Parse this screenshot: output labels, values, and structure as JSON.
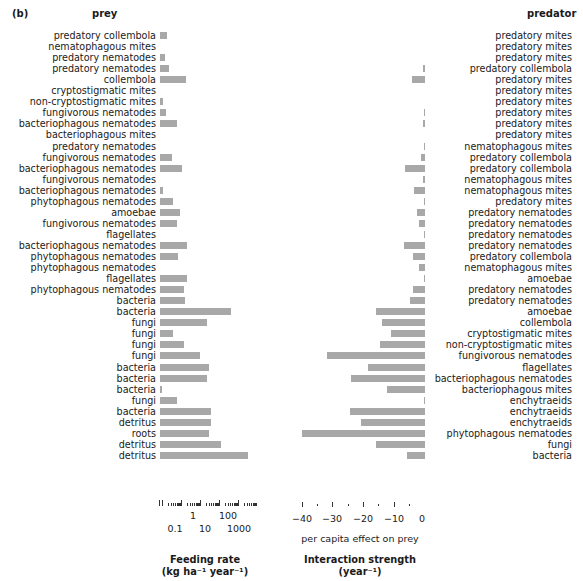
{
  "panel_label": "(b)",
  "headers": {
    "prey": "prey",
    "predator": "predator"
  },
  "axes": {
    "feeding_rate": {
      "tick_labels_top": [
        "1",
        "100"
      ],
      "tick_labels_bottom": [
        "0.1",
        "10",
        "1000"
      ],
      "title_line1": "Feeding rate",
      "title_line2": "(kg ha⁻¹ year⁻¹)"
    },
    "interaction_strength": {
      "tick_labels": [
        "−40",
        "−30",
        "−20",
        "−10",
        "0"
      ],
      "sublabel": "per capita effect on prey",
      "title_line1": "Interaction strength",
      "title_line2": "(year⁻¹)"
    }
  },
  "chart_data": [
    {
      "type": "bar",
      "orientation": "horizontal",
      "title": "Feeding rate (kg ha⁻¹ year⁻¹)",
      "xlabel": "Feeding rate (kg ha⁻¹ year⁻¹)",
      "xscale": "log",
      "xlim": [
        0.05,
        5000
      ],
      "xticks": [
        0.1,
        1,
        10,
        100,
        1000
      ],
      "categories": [
        "predatory collembola",
        "nematophagous mites",
        "predatory nematodes",
        "predatory nematodes",
        "collembola",
        "cryptostigmatic mites",
        "non-cryptostigmatic mites",
        "fungivorous nematodes",
        "bacteriophagous nematodes",
        "bacteriophagous mites",
        "predatory nematodes",
        "fungivorous nematodes",
        "bacteriophagous nematodes",
        "fungivorous nematodes",
        "bacteriophagous nematodes",
        "phytophagous nematodes",
        "amoebae",
        "fungivorous nematodes",
        "flagellates",
        "bacteriophagous nematodes",
        "phytophagous nematodes",
        "phytophagous nematodes",
        "flagellates",
        "phytophagous nematodes",
        "bacteria",
        "bacteria",
        "fungi",
        "fungi",
        "fungi",
        "fungi",
        "bacteria",
        "bacteria",
        "bacteria",
        "fungi",
        "bacteria",
        "detritus",
        "roots",
        "detritus",
        "detritus"
      ],
      "bar_px": [
        7,
        0,
        5,
        9,
        26,
        0,
        3,
        6,
        17,
        0,
        0,
        12,
        22,
        0,
        3,
        13,
        20,
        17,
        0,
        27,
        18,
        0,
        27,
        24,
        25,
        71,
        47,
        13,
        24,
        40,
        49,
        47,
        2,
        17,
        51,
        51,
        49,
        61,
        88
      ]
    },
    {
      "type": "bar",
      "orientation": "horizontal",
      "title": "Interaction strength (year⁻¹)",
      "xlabel": "per capita effect on prey",
      "xlim": [
        -42,
        2
      ],
      "xticks": [
        -40,
        -30,
        -20,
        -10,
        0
      ],
      "categories": [
        "predatory mites",
        "predatory mites",
        "predatory mites",
        "predatory collembola",
        "predatory mites",
        "predatory mites",
        "predatory mites",
        "predatory mites",
        "predatory mites",
        "predatory mites",
        "nematophagous mites",
        "predatory collembola",
        "predatory collembola",
        "nematophagous mites",
        "nematophagous mites",
        "predatory mites",
        "predatory nematodes",
        "predatory nematodes",
        "predatory nematodes",
        "predatory nematodes",
        "predatory collembola",
        "nematophagous mites",
        "amoebae",
        "predatory nematodes",
        "predatory nematodes",
        "amoebae",
        "collembola",
        "cryptostigmatic mites",
        "non-cryptostigmatic mites",
        "fungivorous nematodes",
        "flagellates",
        "bacteriophagous nematodes",
        "bacteriophagous mites",
        "enchytraeids",
        "enchytraeids",
        "enchytraeids",
        "phytophagous nematodes",
        "fungi",
        "bacteria"
      ],
      "values": [
        0,
        0,
        0,
        -0.8,
        -4.2,
        0,
        0,
        -0.3,
        -0.8,
        0,
        -0.3,
        -1.2,
        -6.5,
        -0.5,
        -3.5,
        -0.4,
        -2.5,
        -1.8,
        -0.2,
        -7,
        -4,
        -2,
        -0.2,
        -4,
        -5,
        -16,
        -14,
        -11,
        -14.5,
        -32,
        -18.5,
        -24,
        -12.5,
        -0.4,
        -24.5,
        -21,
        -40,
        -16,
        -6
      ]
    }
  ]
}
